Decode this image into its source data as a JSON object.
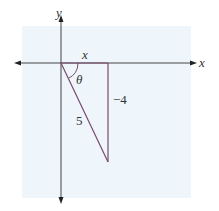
{
  "diagram": {
    "type": "right-triangle-on-coordinate-axes",
    "colors": {
      "background": "#ffffff",
      "panel": "#eef5fb",
      "axis": "#444444",
      "triangle": "#7a4a6e",
      "text": "#333333"
    },
    "axes": {
      "x_label": "x",
      "y_label": "y"
    },
    "triangle": {
      "adjacent_label": "x",
      "opposite_label": "−4",
      "hypotenuse_label": "5",
      "angle_label": "θ"
    }
  }
}
